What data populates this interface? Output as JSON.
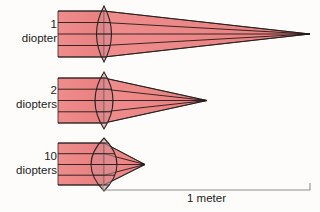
{
  "figure": {
    "background_color": "#fdfcfa",
    "beam_fill": "#ef8c8c",
    "beam_fill_dark": "#e0757a",
    "lens_fill": "#d98c93",
    "ray_stroke": "#231a18",
    "outline_stroke": "#2a2320",
    "scale_stroke": "#8d8d8d",
    "text_color": "#1b1b1b"
  },
  "rows": [
    {
      "id": "row-1-diopter",
      "power_number": "1",
      "power_unit": "diopter",
      "beam_top": 11,
      "beam_bottom": 57,
      "beam_left": 58,
      "lens_center_x": 104,
      "lens_half_width": 15,
      "lens_top": 6,
      "lens_bottom": 62,
      "focal_x": 310,
      "focal_y": 34,
      "ray_count": 5
    },
    {
      "id": "row-2-diopters",
      "power_number": "2",
      "power_unit": "diopters",
      "beam_top": 78,
      "beam_bottom": 123,
      "beam_left": 58,
      "lens_center_x": 104,
      "lens_half_width": 18,
      "lens_top": 72,
      "lens_bottom": 129,
      "focal_x": 207,
      "focal_y": 100,
      "ray_count": 5
    },
    {
      "id": "row-10-diopters",
      "power_number": "10",
      "power_unit": "diopters",
      "beam_top": 143,
      "beam_bottom": 185,
      "beam_left": 58,
      "lens_center_x": 104,
      "lens_half_width": 26,
      "lens_top": 138,
      "lens_bottom": 191,
      "focal_x": 145,
      "focal_y": 164,
      "ray_count": 5
    }
  ],
  "scale": {
    "label": "1 meter",
    "x_start": 103,
    "x_end": 310,
    "y_line": 190,
    "tick_height": 7
  }
}
